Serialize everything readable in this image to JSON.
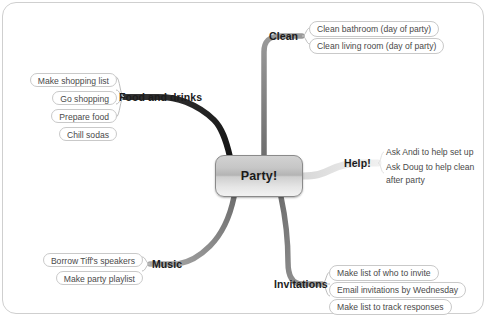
{
  "mindmap": {
    "center": {
      "label": "Party!"
    },
    "branches": [
      {
        "id": "clean",
        "title": "Clean",
        "items": [
          "Clean bathroom (day of party)",
          "Clean living room (day of party)"
        ]
      },
      {
        "id": "food-and-drinks",
        "title": "Food and drinks",
        "items": [
          "Make shopping list",
          "Go shopping",
          "Prepare food",
          "Chill sodas"
        ]
      },
      {
        "id": "help",
        "title": "Help!",
        "items": [
          "Ask Andi to help set up",
          "Ask Doug to help clean after party"
        ]
      },
      {
        "id": "music",
        "title": "Music",
        "items": [
          "Borrow Tiff's speakers",
          "Make party playlist"
        ]
      },
      {
        "id": "invitations",
        "title": "Invitations",
        "items": [
          "Make list of who to invite",
          "Email invitations by Wednesday",
          "Make list to track responses"
        ]
      }
    ]
  },
  "colors": {
    "branch_dark": "#1e1e1e",
    "branch_gray": "#8c8c8c",
    "branch_light": "#e8e8e8",
    "leaf_outline": "#c9c9c9",
    "frame": "#cfcfcf",
    "text": "#4a4a4a"
  }
}
